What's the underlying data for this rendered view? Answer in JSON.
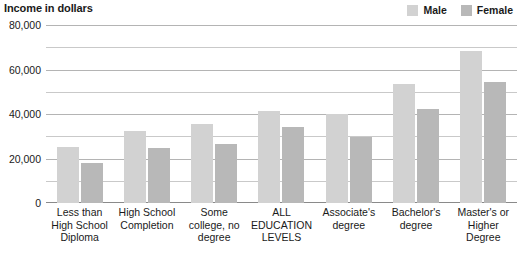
{
  "chart_data": {
    "type": "bar",
    "title": "Income in dollars",
    "xlabel": "",
    "ylabel": "Income in dollars",
    "ylim": [
      0,
      80000
    ],
    "grid": true,
    "grid_interval": 10000,
    "legend_position": "top-right",
    "ytick_labels": [
      "80,000",
      "60,000",
      "40,000",
      "20,000",
      "0"
    ],
    "ytick_values": [
      80000,
      60000,
      40000,
      20000,
      0
    ],
    "categories": [
      "Less than High School Diploma",
      "High School Completion",
      "Some college, no degree",
      "ALL EDUCATION LEVELS",
      "Associate's degree",
      "Bachelor's degree",
      "Master's or Higher Degree"
    ],
    "category_lines": [
      [
        "Less than",
        "High School",
        "Diploma"
      ],
      [
        "High School",
        "Completion"
      ],
      [
        "Some",
        "college, no",
        "degree"
      ],
      [
        "ALL",
        "EDUCATION",
        "LEVELS"
      ],
      [
        "Associate's",
        "degree"
      ],
      [
        "Bachelor's",
        "degree"
      ],
      [
        "Master's or",
        "Higher Degree"
      ]
    ],
    "series": [
      {
        "name": "Male",
        "color": "#d2d2d2",
        "values": [
          25200,
          32300,
          35300,
          41500,
          40000,
          53500,
          68400
        ]
      },
      {
        "name": "Female",
        "color": "#b8b8b8",
        "values": [
          18000,
          24800,
          26700,
          34200,
          29500,
          42100,
          54400
        ]
      }
    ]
  },
  "legend": {
    "items": [
      {
        "label": "Male",
        "color": "#d2d2d2"
      },
      {
        "label": "Female",
        "color": "#b8b8b8"
      }
    ]
  }
}
